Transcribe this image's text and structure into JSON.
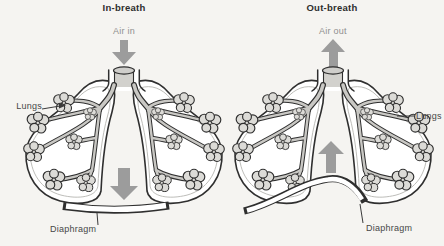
{
  "figure": {
    "background": "#f5f4f1",
    "ink": "#2f2f2f",
    "arrow_gray": "#9c9c9c",
    "alveoli_fill": "#dcdbd7",
    "airway_fill": "#d2d1cd"
  },
  "panels": [
    {
      "id": "inhale",
      "title": "In-breath",
      "air_label": "Air in",
      "air_direction": "down",
      "lungs_label": "Lungs",
      "diaphragm_label": "Diaphragm",
      "diaphragm_state": "flattened",
      "diaphragm_arrow_direction": "down"
    },
    {
      "id": "exhale",
      "title": "Out-breath",
      "air_label": "Air out",
      "air_direction": "up",
      "lungs_label": "Lungs",
      "diaphragm_label": "Diaphragm",
      "diaphragm_state": "domed",
      "diaphragm_arrow_direction": "up"
    }
  ]
}
